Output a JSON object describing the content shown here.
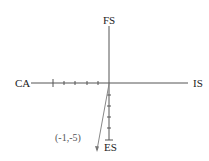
{
  "diagram": {
    "axes": {
      "left_label": "CA",
      "right_label": "IS",
      "top_label": "FS",
      "bottom_label": "ES"
    },
    "point_label": "(-1,-5)",
    "point": {
      "x": -1,
      "y": -5
    },
    "ticks": {
      "negative_x_count": 5,
      "negative_y_count": 5
    },
    "colors": {
      "axis": "#555555",
      "text": "#222222",
      "arrow": "#777777"
    }
  }
}
